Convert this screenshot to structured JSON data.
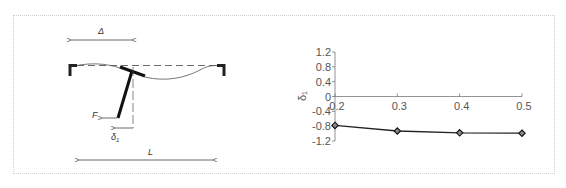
{
  "diagram": {
    "labels": {
      "delta_span": "Δ",
      "force": "F",
      "deflection": "δ",
      "deflection_sub": "1",
      "length": "L"
    }
  },
  "chart_data": {
    "type": "line",
    "title": "",
    "xlabel": "",
    "ylabel": "δ₁",
    "x": [
      0.2,
      0.3,
      0.4,
      0.5
    ],
    "series": [
      {
        "name": "δ₁",
        "values": [
          -0.78,
          -0.93,
          -0.98,
          -0.99
        ],
        "marker": "diamond",
        "color": "#222222"
      }
    ],
    "x_ticks": [
      "0.2",
      "0.3",
      "0.4",
      "0.5"
    ],
    "y_ticks": [
      "1.2",
      "0.8",
      "0.4",
      "0",
      "-0.4",
      "-0.8",
      "-1.2"
    ],
    "xlim": [
      0.2,
      0.5
    ],
    "ylim": [
      -1.2,
      1.2
    ],
    "grid": false,
    "legend": "none"
  }
}
